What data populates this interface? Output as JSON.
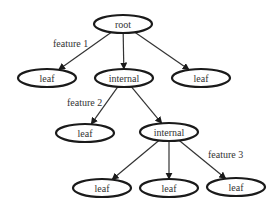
{
  "diagram": {
    "type": "decision-tree",
    "nodes": [
      {
        "id": "root",
        "label": "root",
        "cx": 123,
        "cy": 24
      },
      {
        "id": "leaf1",
        "label": "leaf",
        "cx": 47,
        "cy": 78
      },
      {
        "id": "internal1",
        "label": "internal",
        "cx": 124,
        "cy": 78
      },
      {
        "id": "leaf2",
        "label": "leaf",
        "cx": 201,
        "cy": 78
      },
      {
        "id": "leaf3",
        "label": "leaf",
        "cx": 85,
        "cy": 133
      },
      {
        "id": "internal2",
        "label": "internal",
        "cx": 169,
        "cy": 132
      },
      {
        "id": "leaf4",
        "label": "leaf",
        "cx": 102,
        "cy": 188
      },
      {
        "id": "leaf5",
        "label": "leaf",
        "cx": 169,
        "cy": 188
      },
      {
        "id": "leaf6",
        "label": "leaf",
        "cx": 236,
        "cy": 187
      }
    ],
    "edges": [
      {
        "from": "root",
        "to": "leaf1"
      },
      {
        "from": "root",
        "to": "internal1"
      },
      {
        "from": "root",
        "to": "leaf2"
      },
      {
        "from": "internal1",
        "to": "leaf3"
      },
      {
        "from": "internal1",
        "to": "internal2"
      },
      {
        "from": "internal2",
        "to": "leaf4"
      },
      {
        "from": "internal2",
        "to": "leaf5"
      },
      {
        "from": "internal2",
        "to": "leaf6"
      }
    ],
    "edge_labels": [
      {
        "text": "feature 1",
        "x": 53,
        "y": 47
      },
      {
        "text": "feature 2",
        "x": 67,
        "y": 106
      },
      {
        "text": "feature 3",
        "x": 208,
        "y": 158
      }
    ]
  }
}
